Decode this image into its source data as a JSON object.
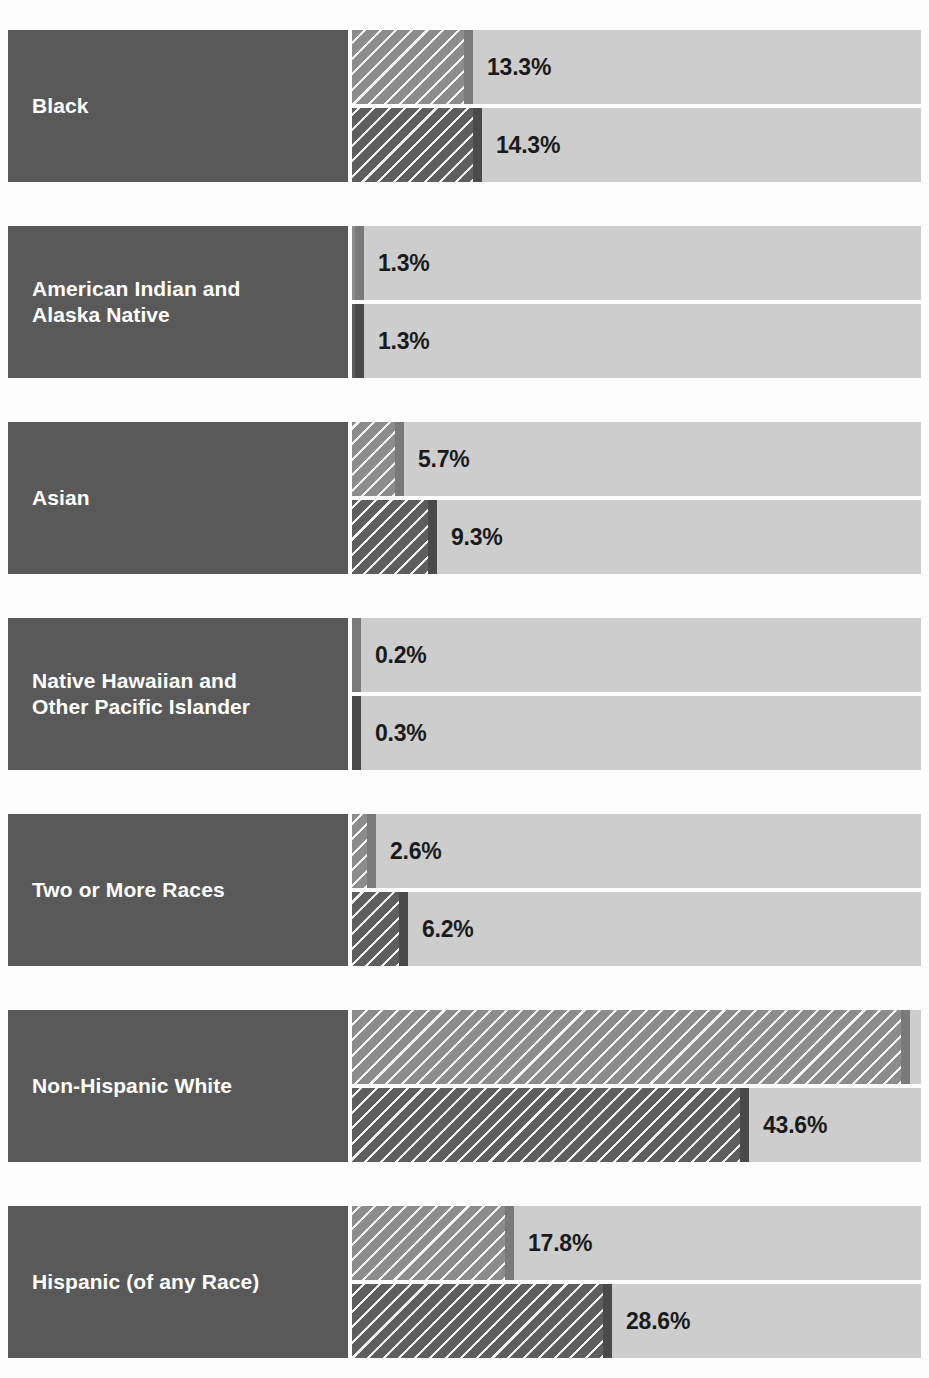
{
  "chart": {
    "title": "",
    "axis_start_px": 352,
    "axis_end_px": 921
  },
  "chart_data": {
    "type": "bar",
    "orientation": "horizontal",
    "title": "",
    "xlabel": "",
    "ylabel": "",
    "xlim": [
      0,
      62.5
    ],
    "grid": false,
    "legend_position": "none",
    "value_suffix": "%",
    "categories": [
      "Black",
      "American Indian and Alaska Native",
      "Asian",
      "Native Hawaiian and Other Pacific Islander",
      "Two or More Races",
      "Non-Hispanic White",
      "Hispanic (of any Race)"
    ],
    "series": [
      {
        "name": "series-1",
        "style": "light-gray-hatched",
        "color": "#8c8c8c",
        "cap_color": "#7a7a7a",
        "values": [
          13.3,
          1.3,
          5.7,
          0.2,
          2.6,
          61.3,
          17.8
        ],
        "labels": [
          "13.3%",
          "1.3%",
          "5.7%",
          "0.2%",
          "2.6%",
          "61.3%",
          "17.8%"
        ]
      },
      {
        "name": "series-2",
        "style": "dark-gray-hatched",
        "color": "#5e5e5e",
        "cap_color": "#4a4a4a",
        "values": [
          14.3,
          1.3,
          9.3,
          0.3,
          6.2,
          43.6,
          28.6
        ],
        "labels": [
          "14.3%",
          "1.3%",
          "9.3%",
          "0.3%",
          "6.2%",
          "43.6%",
          "28.6%"
        ]
      }
    ]
  },
  "colors": {
    "label_background": "#595959",
    "label_text": "#ffffff",
    "track_background": "#cdcdcd",
    "value_text": "#1a1a1a",
    "page_background": "#fdfdfd"
  },
  "rows": [
    {
      "label": "Black",
      "top": 30,
      "height": 152,
      "lines": [
        "Black"
      ]
    },
    {
      "label": "American Indian and Alaska Native",
      "top": 226,
      "height": 152,
      "lines": [
        "American Indian and",
        "Alaska Native"
      ]
    },
    {
      "label": "Asian",
      "top": 422,
      "height": 152,
      "lines": [
        "Asian"
      ]
    },
    {
      "label": "Native Hawaiian and Other Pacific Islander",
      "top": 618,
      "height": 152,
      "lines": [
        "Native Hawaiian and",
        "Other Pacific Islander"
      ]
    },
    {
      "label": "Two or More Races",
      "top": 814,
      "height": 152,
      "lines": [
        "Two or More Races"
      ]
    },
    {
      "label": "Non-Hispanic White",
      "top": 1010,
      "height": 152,
      "lines": [
        "Non-Hispanic White"
      ]
    },
    {
      "label": "Hispanic (of any Race)",
      "top": 1206,
      "height": 152,
      "lines": [
        "Hispanic (of any Race)"
      ]
    }
  ]
}
